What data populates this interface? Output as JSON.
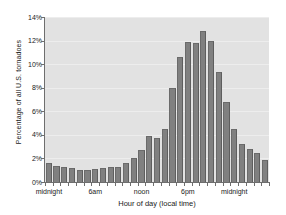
{
  "chart_data": {
    "type": "bar",
    "title": "",
    "subtitle": "",
    "xlabel": "Hour of day (local time)",
    "ylabel": "Percentage of all U.S. tornadoes",
    "ylim": [
      0,
      14
    ],
    "ytick_values": [
      0,
      2,
      4,
      6,
      8,
      10,
      12,
      14
    ],
    "ytick_labels": [
      "0%",
      "2%",
      "4%",
      "6%",
      "8%",
      "10%",
      "12%",
      "14%"
    ],
    "xtick_positions": [
      0,
      6,
      12,
      18,
      24
    ],
    "xtick_labels": [
      "midnight",
      "6am",
      "noon",
      "6pm",
      "midnight"
    ],
    "categories": [
      "0",
      "1",
      "2",
      "3",
      "4",
      "5",
      "6",
      "7",
      "8",
      "9",
      "10",
      "11",
      "12",
      "13",
      "14",
      "15",
      "16",
      "17",
      "18",
      "19",
      "20",
      "21",
      "22",
      "23"
    ],
    "values": [
      1.6,
      1.4,
      1.3,
      1.2,
      1.0,
      1.0,
      1.1,
      1.2,
      1.3,
      1.3,
      1.6,
      2.0,
      2.7,
      3.9,
      3.7,
      4.5,
      8.0,
      10.6,
      11.9,
      11.8,
      12.8,
      12.0,
      9.3,
      6.8
    ],
    "values_extra": [
      4.5,
      3.2,
      2.8,
      2.5,
      1.9
    ],
    "grid": true,
    "legend": false,
    "legend_position": "none",
    "bar_color": "#808080",
    "plot_background": "#e2e2e2",
    "gridline_color": "#ededed",
    "axis_color": "#6e6e6e"
  },
  "bars": [
    {
      "hour": 0,
      "label": "midnight",
      "value": 1.6
    },
    {
      "hour": 1,
      "label": "1am",
      "value": 1.4
    },
    {
      "hour": 2,
      "label": "2am",
      "value": 1.3
    },
    {
      "hour": 3,
      "label": "3am",
      "value": 1.15
    },
    {
      "hour": 4,
      "label": "4am",
      "value": 1.05
    },
    {
      "hour": 5,
      "label": "5am",
      "value": 1.0
    },
    {
      "hour": 6,
      "label": "6am",
      "value": 1.1
    },
    {
      "hour": 7,
      "label": "7am",
      "value": 1.2
    },
    {
      "hour": 8,
      "label": "8am",
      "value": 1.3
    },
    {
      "hour": 9,
      "label": "9am",
      "value": 1.3
    },
    {
      "hour": 10,
      "label": "10am",
      "value": 1.6
    },
    {
      "hour": 11,
      "label": "11am",
      "value": 2.0
    },
    {
      "hour": 12,
      "label": "noon",
      "value": 2.7
    },
    {
      "hour": 13,
      "label": "1pm",
      "value": 3.9
    },
    {
      "hour": 14,
      "label": "2pm",
      "value": 3.7
    },
    {
      "hour": 15,
      "label": "3pm",
      "value": 4.5
    },
    {
      "hour": 16,
      "label": "4pm",
      "value": 8.0
    },
    {
      "hour": 17,
      "label": "5pm",
      "value": 10.6
    },
    {
      "hour": 18,
      "label": "6pm",
      "value": 11.9
    },
    {
      "hour": 19,
      "label": "7pm",
      "value": 11.8
    },
    {
      "hour": 20,
      "label": "8pm",
      "value": 12.8
    },
    {
      "hour": 21,
      "label": "9pm",
      "value": 12.0
    },
    {
      "hour": 22,
      "label": "10pm",
      "value": 9.3
    },
    {
      "hour": 23,
      "label": "11pm",
      "value": 6.8
    },
    {
      "hour": 24,
      "label": "12am",
      "value": 4.5
    },
    {
      "hour": 25,
      "label": "1am",
      "value": 3.2
    },
    {
      "hour": 26,
      "label": "2am",
      "value": 2.8
    },
    {
      "hour": 27,
      "label": "3am",
      "value": 2.5
    },
    {
      "hour": 28,
      "label": "4am",
      "value": 1.9
    }
  ]
}
